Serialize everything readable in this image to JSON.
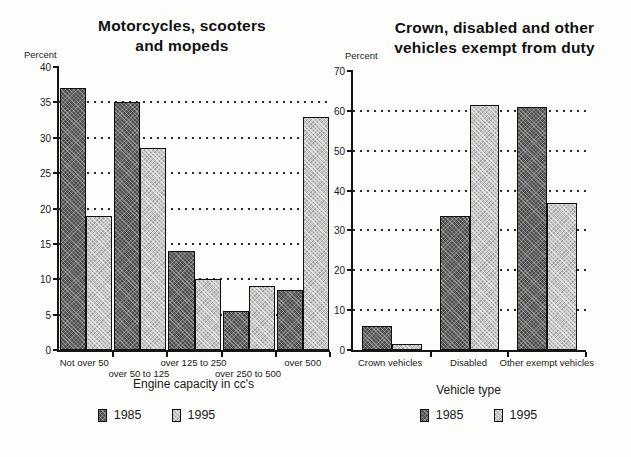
{
  "page": {
    "background": "#fdfdfc",
    "text_color": "#1a1a1a"
  },
  "colors": {
    "series_1985": "#4f4f4f",
    "series_1995": "#c7c7c7",
    "axis": "#151515",
    "grid_dot": "#2b2b2b"
  },
  "chart_data": [
    {
      "type": "bar",
      "title": "Motorcycles, scooters and mopeds",
      "title_line1": "Motorcycles, scooters",
      "title_line2": "and mopeds",
      "y_unit_label": "Percent",
      "xlabel": "Engine capacity in cc's",
      "ylim": [
        0,
        40
      ],
      "yticks": [
        0,
        5,
        10,
        15,
        20,
        25,
        30,
        35,
        40
      ],
      "gridlines": [
        5,
        10,
        15,
        20,
        25,
        30,
        35
      ],
      "grid_style": "dotted",
      "legend_position": "bottom",
      "staggered_category_labels": true,
      "categories": [
        "Not over 50",
        "over 50 to 125",
        "over 125 to 250",
        "over 250 to 500",
        "over 500"
      ],
      "series": [
        {
          "name": "1985",
          "values": [
            37,
            35,
            14,
            5.5,
            8.5
          ]
        },
        {
          "name": "1995",
          "values": [
            19,
            28.5,
            10,
            9,
            33
          ]
        }
      ]
    },
    {
      "type": "bar",
      "title": "Crown, disabled and other vehicles exempt from duty",
      "title_line1": "Crown, disabled and other",
      "title_line2": "vehicles exempt from duty",
      "y_unit_label": "Percent",
      "xlabel": "Vehicle type",
      "ylim": [
        0,
        70
      ],
      "yticks": [
        0,
        10,
        20,
        30,
        40,
        50,
        60,
        70
      ],
      "gridlines": [
        10,
        20,
        30,
        40,
        50,
        60
      ],
      "grid_style": "dotted",
      "legend_position": "bottom",
      "staggered_category_labels": false,
      "categories": [
        "Crown vehicles",
        "Disabled",
        "Other exempt vehicles"
      ],
      "series": [
        {
          "name": "1985",
          "values": [
            6,
            33.5,
            61
          ]
        },
        {
          "name": "1995",
          "values": [
            1.5,
            61.5,
            37
          ]
        }
      ]
    }
  ]
}
